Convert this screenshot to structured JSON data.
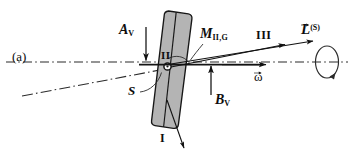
{
  "figure": {
    "panel_label": "(a)",
    "caption_colors": {
      "ink": "#0d0d0d",
      "body_fill": "#b3b3b3",
      "body_stroke": "#1a1a1a",
      "axis": "#262626"
    }
  },
  "labels": {
    "force_a": {
      "symbol": "A",
      "sub": "V"
    },
    "force_b": {
      "symbol": "B",
      "sub": "V"
    },
    "moment_m": {
      "symbol": "M",
      "sub": "II,G"
    },
    "angular_momentum": {
      "symbol": "L",
      "sup": "(S)"
    },
    "omega": {
      "symbol": "ω"
    },
    "axis_two": "II",
    "axis_three": "III",
    "axis_one": "I",
    "point_s": "S"
  },
  "elements": {
    "body": "tilted-rounded-rectangular-block",
    "rotation_indicator": "spin-ellipse-with-arrow",
    "dash_dot_axis": "horizontal-reference-axis",
    "tilted_dash_dot_axis": "inclined-reference-axis"
  }
}
